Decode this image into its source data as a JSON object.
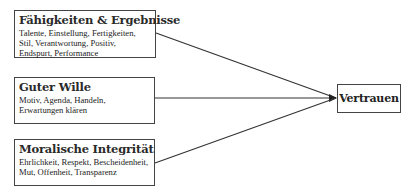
{
  "diagram": {
    "sources": [
      {
        "title": "Fähigkeiten & Ergebnisse",
        "description": "Talente, Einstellung, Fertigkeiten, Stil, Verantwortung, Positiv, Endspurt, Performance"
      },
      {
        "title": "Guter Wille",
        "description": "Motiv, Agenda, Handeln, Erwartungen klären"
      },
      {
        "title": "Moralische Integrität",
        "description": "Ehrlichkeit, Respekt, Bescheidenheit, Mut, Offenheit, Transparenz"
      }
    ],
    "target": {
      "title": "Vertrauen"
    },
    "colors": {
      "border": "#444444",
      "line": "#333333",
      "background": "#ffffff"
    }
  }
}
